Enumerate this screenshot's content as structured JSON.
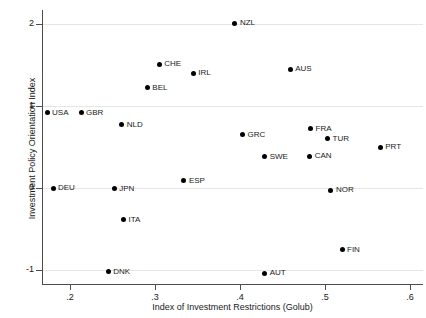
{
  "chart_data": {
    "type": "scatter",
    "title": "",
    "xlabel": "Index of Investment Restrictions (Golub)",
    "ylabel": "Investment Policy Orientation Index",
    "xlim": [
      0.16,
      0.61
    ],
    "ylim": [
      -1.15,
      2.15
    ],
    "xticks": [
      ".2",
      ".3",
      ".4",
      ".5",
      ".6"
    ],
    "xtick_values": [
      0.2,
      0.3,
      0.4,
      0.5,
      0.6
    ],
    "yticks": [
      "2",
      "1",
      "0",
      "-1"
    ],
    "ytick_values": [
      2,
      1,
      0,
      -1
    ],
    "grid": "horizontal",
    "legend": "none",
    "marker_color": "#000000",
    "points": [
      {
        "label": "USA",
        "x": 0.173,
        "y": 0.92
      },
      {
        "label": "GBR",
        "x": 0.213,
        "y": 0.92
      },
      {
        "label": "DEU",
        "x": 0.18,
        "y": 0.0
      },
      {
        "label": "DNK",
        "x": 0.245,
        "y": -1.02
      },
      {
        "label": "JPN",
        "x": 0.252,
        "y": -0.01
      },
      {
        "label": "NLD",
        "x": 0.261,
        "y": 0.77
      },
      {
        "label": "ITA",
        "x": 0.263,
        "y": -0.39
      },
      {
        "label": "BEL",
        "x": 0.291,
        "y": 1.22
      },
      {
        "label": "CHE",
        "x": 0.305,
        "y": 1.51
      },
      {
        "label": "ESP",
        "x": 0.334,
        "y": 0.09
      },
      {
        "label": "IRL",
        "x": 0.345,
        "y": 1.4
      },
      {
        "label": "NZL",
        "x": 0.394,
        "y": 2.01
      },
      {
        "label": "GRC",
        "x": 0.403,
        "y": 0.65
      },
      {
        "label": "SWE",
        "x": 0.429,
        "y": 0.38
      },
      {
        "label": "AUT",
        "x": 0.429,
        "y": -1.04
      },
      {
        "label": "AUS",
        "x": 0.459,
        "y": 1.45
      },
      {
        "label": "CAN",
        "x": 0.482,
        "y": 0.39
      },
      {
        "label": "FRA",
        "x": 0.483,
        "y": 0.72
      },
      {
        "label": "TUR",
        "x": 0.503,
        "y": 0.6
      },
      {
        "label": "NOR",
        "x": 0.507,
        "y": -0.03
      },
      {
        "label": "FIN",
        "x": 0.52,
        "y": -0.75
      },
      {
        "label": "PRT",
        "x": 0.565,
        "y": 0.5
      }
    ]
  }
}
